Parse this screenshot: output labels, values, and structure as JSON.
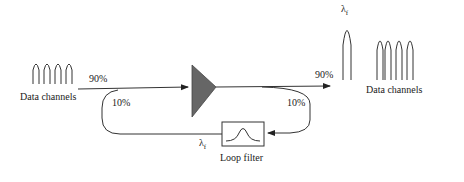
{
  "diagram": {
    "input": {
      "label": "Data channels",
      "split_in": "90%"
    },
    "loop": {
      "tap_in": "10%",
      "tap_out": "10%",
      "lambda_label": "λ",
      "lambda_sub": "f"
    },
    "output": {
      "split_out": "90%",
      "label": "Data channels",
      "lambda_label": "λ",
      "lambda_sub": "f"
    },
    "filter": {
      "label": "Loop filter"
    },
    "colors": {
      "amplifier": "#666666",
      "line": "#333333"
    }
  }
}
